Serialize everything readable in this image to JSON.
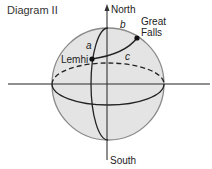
{
  "title": "Diagram II",
  "axis": {
    "north_label": "North",
    "south_label": "South"
  },
  "points": [
    {
      "name": "Lemhi",
      "label": "Lemhi"
    },
    {
      "name": "Great Falls",
      "label_line1": "Great",
      "label_line2": "Falls"
    }
  ],
  "arcs": {
    "a": "a",
    "b": "b",
    "c": "c"
  },
  "colors": {
    "sphere_fill": "#e4e4e4",
    "sphere_outline": "#8a8a8a",
    "lines": "#222222",
    "equator_plane_line": "#6a6a6a"
  }
}
